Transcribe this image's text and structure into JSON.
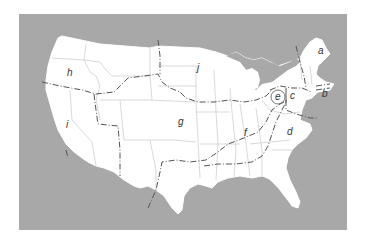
{
  "map": {
    "title": "United States regions map",
    "colors": {
      "background": "#ffffff",
      "water": "#a8a8a8",
      "land": "#ffffff",
      "state_lines": "#c8c8c8",
      "boundary_lines": "#555555",
      "label": "#333333"
    },
    "labels": [
      {
        "id": "a",
        "text": "a",
        "x": 318,
        "y": 54
      },
      {
        "id": "b",
        "text": "b",
        "x": 322,
        "y": 97
      },
      {
        "id": "c",
        "text": "c",
        "x": 292,
        "y": 99
      },
      {
        "id": "d",
        "text": "d",
        "x": 287,
        "y": 135
      },
      {
        "id": "e",
        "text": "e",
        "x": 275,
        "y": 100
      },
      {
        "id": "f",
        "text": "f",
        "x": 244,
        "y": 136
      },
      {
        "id": "g",
        "text": "g",
        "x": 178,
        "y": 125
      },
      {
        "id": "h",
        "text": "h",
        "x": 67,
        "y": 76
      },
      {
        "id": "i",
        "text": "i",
        "x": 66,
        "y": 128
      },
      {
        "id": "j",
        "text": "j",
        "x": 197,
        "y": 71
      }
    ]
  }
}
